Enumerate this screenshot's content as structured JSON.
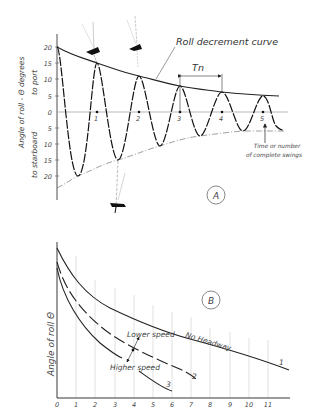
{
  "diagram_a": {
    "label": "A",
    "title_annotation": "Roll decrement curve",
    "period_label": "Tn",
    "y_axis_label_top": "Angle of roll - Θ degrees",
    "y_axis_label_port": "to port",
    "y_axis_label_starboard": "to starboard",
    "y_ticks": [
      "20",
      "15",
      "10",
      "5",
      "0",
      "5",
      "10",
      "15",
      "20"
    ],
    "swing_markers": [
      "1",
      "2",
      "3",
      "4",
      "5"
    ],
    "time_label_line1": "Time or number",
    "time_label_line2": "of complete swings",
    "peaks_deg": [
      20,
      15,
      11,
      8,
      6,
      5
    ],
    "troughs_deg": [
      -20,
      -15,
      -10.5,
      -7.5,
      -6
    ]
  },
  "diagram_b": {
    "label": "B",
    "y_axis_label": "Angle of roll Θ",
    "x_ticks": [
      "0",
      "1",
      "2",
      "3",
      "4",
      "5",
      "6",
      "7",
      "8",
      "9",
      "10",
      "11"
    ],
    "curves": [
      {
        "id": "1",
        "label": "No Headway"
      },
      {
        "id": "2",
        "label": ""
      },
      {
        "id": "3",
        "label": ""
      }
    ],
    "annotation_lower": "Lower speed",
    "annotation_higher": "Higher speed"
  }
}
